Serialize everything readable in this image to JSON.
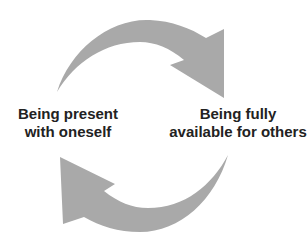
{
  "diagram": {
    "type": "cycle",
    "arrow_color": "#a9a9a9",
    "text_color": "#222222",
    "nodes": {
      "left": {
        "line1": "Being present",
        "line2": "with oneself"
      },
      "right": {
        "line1": "Being fully",
        "line2": "available for others"
      }
    },
    "edges": [
      {
        "from": "left",
        "to": "right",
        "position": "top",
        "direction": "clockwise"
      },
      {
        "from": "right",
        "to": "left",
        "position": "bottom",
        "direction": "clockwise"
      }
    ]
  }
}
